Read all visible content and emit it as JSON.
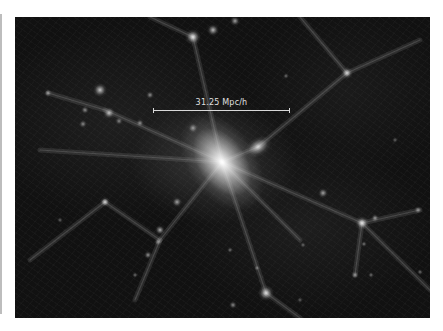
{
  "figure": {
    "background_color": "#111111",
    "halo_color": "#ffffff",
    "scale_bar": {
      "label": "31.25 Mpc/h",
      "x1": 153,
      "x2": 290,
      "y": 110,
      "color": "#d8d8d8"
    },
    "central_cluster": {
      "x": 222,
      "y": 162
    },
    "halos": [
      {
        "x": 222,
        "y": 162,
        "r": 34,
        "i": 1.0,
        "rx": 1.0,
        "ry": 1.6,
        "rot": -35
      },
      {
        "x": 258,
        "y": 147,
        "r": 12,
        "i": 0.75,
        "rx": 1.2,
        "ry": 0.8,
        "rot": -30
      },
      {
        "x": 193,
        "y": 37,
        "r": 8,
        "i": 0.85
      },
      {
        "x": 213,
        "y": 30,
        "r": 6,
        "i": 0.7
      },
      {
        "x": 235,
        "y": 21,
        "r": 5,
        "i": 0.6
      },
      {
        "x": 100,
        "y": 90,
        "r": 7,
        "i": 0.75
      },
      {
        "x": 109,
        "y": 113,
        "r": 6,
        "i": 0.7
      },
      {
        "x": 48,
        "y": 93,
        "r": 4,
        "i": 0.55
      },
      {
        "x": 85,
        "y": 110,
        "r": 4,
        "i": 0.5
      },
      {
        "x": 83,
        "y": 124,
        "r": 4,
        "i": 0.5
      },
      {
        "x": 119,
        "y": 121,
        "r": 4,
        "i": 0.45
      },
      {
        "x": 150,
        "y": 95,
        "r": 4,
        "i": 0.5
      },
      {
        "x": 140,
        "y": 123,
        "r": 4,
        "i": 0.5
      },
      {
        "x": 193,
        "y": 128,
        "r": 5,
        "i": 0.55
      },
      {
        "x": 347,
        "y": 73,
        "r": 6,
        "i": 0.7
      },
      {
        "x": 286,
        "y": 76,
        "r": 3,
        "i": 0.4
      },
      {
        "x": 105,
        "y": 202,
        "r": 5,
        "i": 0.75
      },
      {
        "x": 177,
        "y": 202,
        "r": 5,
        "i": 0.6
      },
      {
        "x": 160,
        "y": 230,
        "r": 5,
        "i": 0.65
      },
      {
        "x": 148,
        "y": 255,
        "r": 4,
        "i": 0.55
      },
      {
        "x": 158,
        "y": 242,
        "r": 4,
        "i": 0.5
      },
      {
        "x": 135,
        "y": 275,
        "r": 3,
        "i": 0.4
      },
      {
        "x": 60,
        "y": 220,
        "r": 3,
        "i": 0.35
      },
      {
        "x": 266,
        "y": 293,
        "r": 8,
        "i": 0.8
      },
      {
        "x": 233,
        "y": 305,
        "r": 4,
        "i": 0.5
      },
      {
        "x": 230,
        "y": 250,
        "r": 3,
        "i": 0.4
      },
      {
        "x": 257,
        "y": 268,
        "r": 3,
        "i": 0.4
      },
      {
        "x": 362,
        "y": 223,
        "r": 7,
        "i": 0.8
      },
      {
        "x": 375,
        "y": 218,
        "r": 4,
        "i": 0.55
      },
      {
        "x": 323,
        "y": 193,
        "r": 5,
        "i": 0.6
      },
      {
        "x": 364,
        "y": 244,
        "r": 3,
        "i": 0.4
      },
      {
        "x": 418,
        "y": 210,
        "r": 4,
        "i": 0.5
      },
      {
        "x": 420,
        "y": 272,
        "r": 3,
        "i": 0.4
      },
      {
        "x": 355,
        "y": 275,
        "r": 4,
        "i": 0.5
      },
      {
        "x": 371,
        "y": 275,
        "r": 3,
        "i": 0.4
      },
      {
        "x": 303,
        "y": 245,
        "r": 3,
        "i": 0.35
      },
      {
        "x": 395,
        "y": 140,
        "r": 3,
        "i": 0.35
      },
      {
        "x": 300,
        "y": 300,
        "r": 3,
        "i": 0.35
      }
    ],
    "filaments": [
      [
        222,
        162,
        193,
        37
      ],
      [
        222,
        162,
        105,
        110
      ],
      [
        222,
        162,
        258,
        147
      ],
      [
        258,
        147,
        347,
        73
      ],
      [
        222,
        162,
        160,
        240
      ],
      [
        160,
        240,
        105,
        202
      ],
      [
        160,
        240,
        135,
        300
      ],
      [
        222,
        162,
        266,
        293
      ],
      [
        222,
        162,
        362,
        223
      ],
      [
        362,
        223,
        420,
        210
      ],
      [
        362,
        223,
        355,
        275
      ],
      [
        222,
        162,
        40,
        150
      ],
      [
        105,
        110,
        48,
        93
      ],
      [
        193,
        37,
        150,
        17
      ],
      [
        347,
        73,
        420,
        40
      ],
      [
        266,
        293,
        300,
        318
      ],
      [
        222,
        162,
        300,
        240
      ],
      [
        105,
        202,
        30,
        260
      ],
      [
        347,
        73,
        300,
        17
      ],
      [
        362,
        223,
        430,
        290
      ]
    ]
  }
}
